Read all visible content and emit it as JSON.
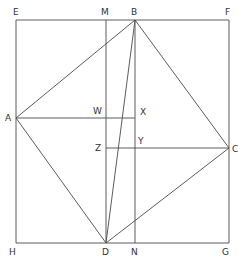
{
  "diagram": {
    "type": "geometric-construction",
    "colors": {
      "line": "#4a4a4a",
      "label": "#333333",
      "background": "#ffffff"
    },
    "points": {
      "E": {
        "label": "E",
        "x": 16,
        "y": 20
      },
      "M": {
        "label": "M",
        "x": 106,
        "y": 20
      },
      "B": {
        "label": "B",
        "x": 135,
        "y": 20
      },
      "F": {
        "label": "F",
        "x": 229,
        "y": 20
      },
      "A": {
        "label": "A",
        "x": 16,
        "y": 118
      },
      "W": {
        "label": "W",
        "x": 106,
        "y": 118
      },
      "X": {
        "label": "X",
        "x": 135,
        "y": 118
      },
      "Z": {
        "label": "Z",
        "x": 106,
        "y": 148
      },
      "Y": {
        "label": "Y",
        "x": 135,
        "y": 148
      },
      "C": {
        "label": "C",
        "x": 229,
        "y": 148
      },
      "H": {
        "label": "H",
        "x": 16,
        "y": 243
      },
      "D": {
        "label": "D",
        "x": 106,
        "y": 243
      },
      "N": {
        "label": "N",
        "x": 135,
        "y": 243
      },
      "G": {
        "label": "G",
        "x": 229,
        "y": 243
      }
    },
    "segments": [
      [
        "E",
        "F"
      ],
      [
        "F",
        "G"
      ],
      [
        "G",
        "H"
      ],
      [
        "H",
        "E"
      ],
      [
        "M",
        "D"
      ],
      [
        "B",
        "N"
      ],
      [
        "A",
        "B"
      ],
      [
        "B",
        "C"
      ],
      [
        "C",
        "D"
      ],
      [
        "D",
        "A"
      ],
      [
        "B",
        "D"
      ],
      [
        "A",
        "X"
      ],
      [
        "Z",
        "C"
      ]
    ]
  }
}
